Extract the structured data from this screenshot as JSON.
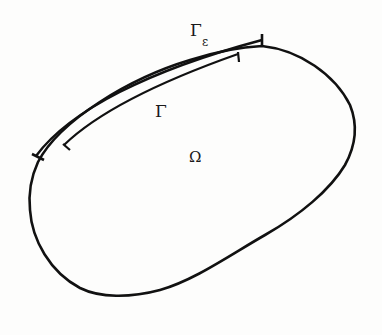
{
  "diagram": {
    "labels": {
      "gamma_eps_main": "Γ",
      "gamma_eps_sub": "ε",
      "gamma": "Γ",
      "omega": "Ω"
    },
    "colors": {
      "stroke": "#111111",
      "background": "#fdfdfc"
    }
  }
}
